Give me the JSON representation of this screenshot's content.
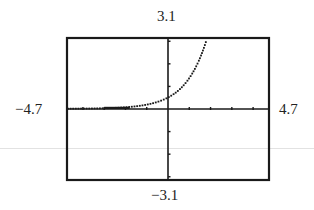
{
  "window": {
    "ymax_label": "3.1",
    "ymin_label": "−3.1",
    "xmin_label": "−4.7",
    "xmax_label": "4.7"
  },
  "chart_data": {
    "type": "line",
    "title": "",
    "xlabel": "",
    "ylabel": "",
    "xlim": [
      -4.7,
      4.7
    ],
    "ylim": [
      -3.1,
      3.1
    ],
    "xscale_ticks": [
      -4,
      -3,
      -2,
      -1,
      1,
      2,
      3,
      4
    ],
    "yscale_ticks": [
      -3,
      -2,
      -1,
      1,
      2,
      3
    ],
    "grid": false,
    "legend": null,
    "series": [
      {
        "name": "exponential",
        "style": "dotted",
        "x": [
          -4.7,
          -4,
          -3,
          -2,
          -1,
          0,
          0.5,
          1,
          1.5,
          1.8
        ],
        "y": [
          0.005,
          0.009,
          0.025,
          0.068,
          0.184,
          0.5,
          0.82,
          1.36,
          2.24,
          3.02
        ]
      }
    ],
    "annotations": [
      "3.1",
      "−3.1",
      "−4.7",
      "4.7"
    ]
  }
}
